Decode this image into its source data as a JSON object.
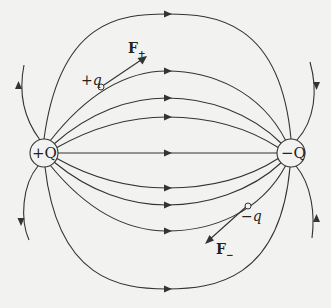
{
  "diagram": {
    "colors": {
      "background": "#f2f2f0",
      "line": "#333333",
      "text": "#222222"
    },
    "charges": [
      {
        "id": "positive",
        "label": "+Q",
        "cx": 44,
        "cy": 153
      },
      {
        "id": "negative",
        "label": "−Q",
        "cx": 291,
        "cy": 153
      }
    ],
    "test_charges": [
      {
        "id": "positive-test",
        "sign": "+",
        "symbol": "q",
        "force_label": "F",
        "force_sub": "+"
      },
      {
        "id": "negative-test",
        "sign": "−",
        "symbol": "q",
        "force_label": "F",
        "force_sub": "−"
      }
    ],
    "field_lines_count": 9,
    "outer_lines_count": 4
  }
}
